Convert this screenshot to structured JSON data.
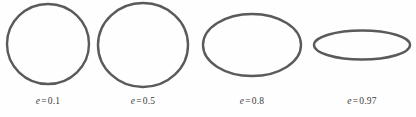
{
  "figure": {
    "background_color": "#fefefe",
    "stroke_color": "#5a5a5a",
    "label_color": "#3b3b3b",
    "width": 416,
    "height": 117
  },
  "chart_data": {
    "type": "diagram",
    "xlabel": "",
    "ylabel": "",
    "symbol": "e",
    "equals": "=",
    "categories": [
      "0.1",
      "0.5",
      "0.8",
      "0.97"
    ],
    "values": [
      0.1,
      0.5,
      0.8,
      0.97
    ],
    "ellipses": [
      {
        "label": "e = 0.1",
        "symbol": "e",
        "equals": "=",
        "value": "0.1",
        "eccentricity": 0.1,
        "center_x": 48,
        "center_y": 44,
        "semi_major": 41,
        "semi_minor": 40,
        "label_x": 48,
        "label_y": 96
      },
      {
        "label": "e = 0.5",
        "symbol": "e",
        "equals": "=",
        "value": "0.5",
        "eccentricity": 0.5,
        "center_x": 143,
        "center_y": 45,
        "semi_major": 45,
        "semi_minor": 42,
        "label_x": 143,
        "label_y": 96
      },
      {
        "label": "e = 0.8",
        "symbol": "e",
        "equals": "=",
        "value": "0.8",
        "eccentricity": 0.8,
        "center_x": 252,
        "center_y": 45,
        "semi_major": 49,
        "semi_minor": 31,
        "label_x": 252,
        "label_y": 96
      },
      {
        "label": "e = 0.97",
        "symbol": "e",
        "equals": "=",
        "value": "0.97",
        "eccentricity": 0.97,
        "center_x": 362,
        "center_y": 45,
        "semi_major": 48,
        "semi_minor": 14.5,
        "label_x": 362,
        "label_y": 96
      }
    ]
  }
}
